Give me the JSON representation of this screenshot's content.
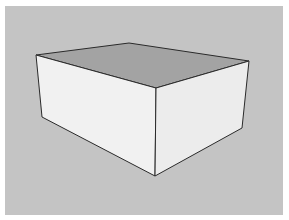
{
  "scene": {
    "description": "3D rendered box in perspective on gray background",
    "colors": {
      "background": "#c4c4c4",
      "top_face": "#a3a3a3",
      "left_face": "#f1f1f1",
      "right_face": "#ececec",
      "edge": "#2a2a2a"
    },
    "vertices": {
      "top_back": [
        129,
        43
      ],
      "top_left": [
        36,
        55
      ],
      "top_right": [
        249,
        61
      ],
      "top_front": [
        156,
        88
      ],
      "bottom_left": [
        42,
        117
      ],
      "bottom_right": [
        242,
        128
      ],
      "bottom_front": [
        155,
        176
      ]
    }
  }
}
